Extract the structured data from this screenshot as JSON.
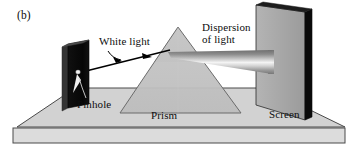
{
  "figure": {
    "panel_letter": "(b)",
    "domain": "physics-optics-diagram",
    "caption_labels": {
      "white_light": "White light",
      "dispersion_line1": "Dispersion",
      "dispersion_line2": "of light",
      "pinhole": "Pinhole",
      "prism": "Prism",
      "screen": "Screen"
    }
  },
  "colors": {
    "background": "#ffffff",
    "base_top": "#d2d2d2",
    "base_front": "#d8d8d8",
    "base_outline": "#4a4a4a",
    "prism_upper": "#cacaca",
    "prism_lower": "#c2c2c2",
    "prism_outline": "#6b6b6b",
    "plate_face": "#0b0b0b",
    "plate_edge": "#3a3a3a",
    "pinhole_spot": "#f2f2f2",
    "screen_face": "#a9a9a9",
    "screen_edge": "#0a0a0a",
    "ray_line": "#000000",
    "beam_light": "#f4f4f4",
    "beam_dark": "#6f6f6f"
  },
  "elements": {
    "base": {
      "name": "base-platform",
      "top_polygon": "17,127 75,88 265,88 345,127",
      "front_rect": {
        "x": 13,
        "y": 128,
        "width": 332,
        "height": 15
      }
    },
    "prism": {
      "name": "triangular-prism",
      "apex": {
        "x": 178,
        "y": 27
      },
      "base_left": {
        "x": 120,
        "y": 113
      },
      "base_right": {
        "x": 241,
        "y": 113
      }
    },
    "pinhole_plate": {
      "name": "pinhole-plate",
      "face": "67,44 88,40 88,104 67,108",
      "edge": "63,46 67,44 67,108 63,110",
      "hole": {
        "cx": 78,
        "cy": 72,
        "r": 2.2
      }
    },
    "screen": {
      "name": "projection-screen",
      "face": "256,5 305,12 305,120 256,105",
      "edge": "305,12 311,10 311,118 305,120"
    },
    "incident_ray": {
      "name": "white-light-ray",
      "from": {
        "x": 78,
        "y": 73
      },
      "to": {
        "x": 167,
        "y": 51
      }
    },
    "dispersed_beam": {
      "name": "dispersed-light-beam",
      "from_apex": {
        "x": 168,
        "y": 52
      },
      "screen_top": {
        "x": 272,
        "y": 55
      },
      "screen_bottom": {
        "x": 272,
        "y": 72
      }
    }
  }
}
